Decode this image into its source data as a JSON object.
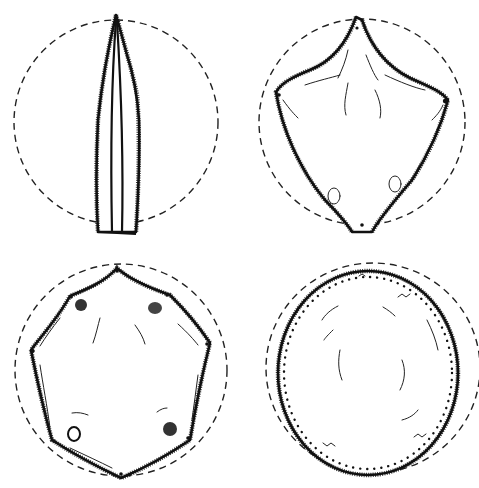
{
  "figure": {
    "width": 479,
    "height": 488,
    "background": "#ffffff",
    "ink_color": "#111111",
    "panels": [
      {
        "id": "panel-1",
        "position": "top-left",
        "description": "narrow folded leaf inside dashed circle",
        "shape": "narrow-lanceolate"
      },
      {
        "id": "panel-2",
        "position": "top-right",
        "description": "kite/diamond shaped leaf with fuzzy margins inside dashed circle",
        "shape": "kite"
      },
      {
        "id": "panel-3",
        "position": "bottom-left",
        "description": "heptagonal leaf with dotted vertices and spots inside dashed circle",
        "shape": "heptagon"
      },
      {
        "id": "panel-4",
        "position": "bottom-right",
        "description": "rounded oval leaf with dotted margin inside dashed circle",
        "shape": "oval"
      }
    ]
  }
}
